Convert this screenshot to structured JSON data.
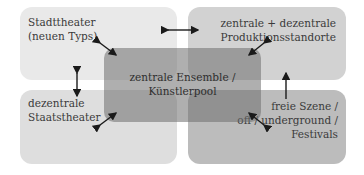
{
  "diagram": {
    "boxes": {
      "top_left": {
        "label": "Stadttheater\n(neuen Typs)",
        "color": "#e9e9e9"
      },
      "top_right": {
        "label": "zentrale + dezentrale\nProduktionsstandorte",
        "color": "#d2d2d2"
      },
      "bottom_left": {
        "label": "dezentrale\nStaatstheater",
        "color": "#dedede"
      },
      "bottom_right": {
        "label": "freie Szene /\noff / underground /\nFestivals",
        "color": "#bcbcbc"
      },
      "center": {
        "label": "zentrale Ensemble /\nKünstlerpool",
        "color": "#6e6e6e"
      }
    },
    "arrows": [
      {
        "from": "top_left",
        "to": "top_right",
        "type": "double-headed horizontal"
      },
      {
        "from": "top_left",
        "to": "bottom_left",
        "type": "double-headed vertical"
      },
      {
        "from": "bottom_right",
        "to": "top_right",
        "type": "single-headed vertical up"
      },
      {
        "from": "top_left",
        "to": "center",
        "type": "double-headed diagonal"
      },
      {
        "from": "top_right",
        "to": "center",
        "type": "double-headed diagonal"
      },
      {
        "from": "bottom_left",
        "to": "center",
        "type": "double-headed diagonal"
      },
      {
        "from": "bottom_right",
        "to": "center",
        "type": "double-headed diagonal"
      }
    ]
  }
}
